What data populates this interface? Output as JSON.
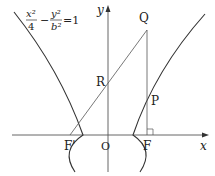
{
  "diagram": {
    "equation": {
      "x_term_num": "x²",
      "x_term_den": "4",
      "minus": "−",
      "y_term_num": "y²",
      "y_term_den": "b²",
      "rhs": "=1"
    },
    "axes": {
      "x_label": "x",
      "y_label": "y"
    },
    "points": {
      "Q": "Q",
      "R": "R",
      "P": "P",
      "F": "F",
      "F_prime": "F'",
      "O": "O"
    },
    "colors": {
      "stroke": "#333333",
      "background": "#ffffff"
    }
  }
}
